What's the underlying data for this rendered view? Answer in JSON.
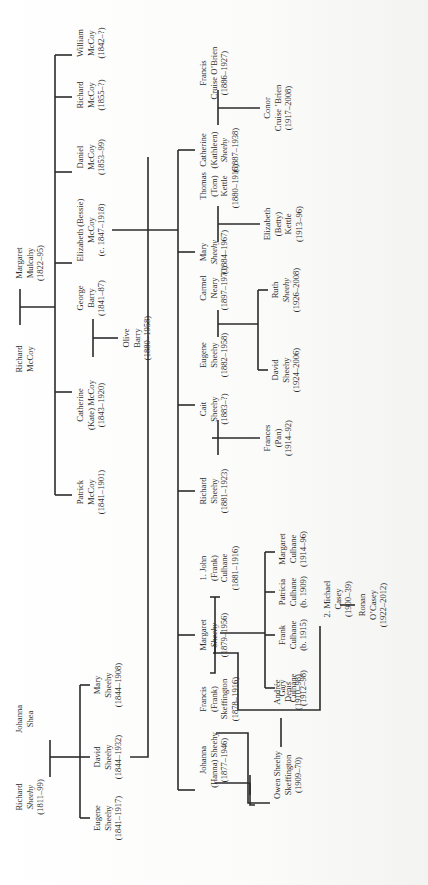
{
  "diagram": {
    "type": "family-tree",
    "orientation": "rotated-90-ccw",
    "line_color": "#2b2b2b",
    "background": "#fbfbfa"
  },
  "people": {
    "richard_sheehy_sr": {
      "lines": [
        "Richard",
        "Sheehy",
        "(1811–99)"
      ]
    },
    "johanna_shea": {
      "lines": [
        "Johanna",
        "Shea"
      ]
    },
    "eugene_sheehy_sr": {
      "lines": [
        "Eugene",
        "Sheehy",
        "(1841–1917)"
      ]
    },
    "david_sheehy": {
      "lines": [
        "David",
        "Sheehy",
        "(1844–1932)"
      ]
    },
    "mary_sheehy_sr": {
      "lines": [
        "Mary",
        "Sheehy",
        "(1844–1908)"
      ]
    },
    "richard_mccoy": {
      "lines": [
        "Richard",
        "McCoy"
      ]
    },
    "margaret_mulcahy": {
      "lines": [
        "Margaret",
        "Mulcahy",
        "(1822–95)"
      ]
    },
    "patrick_mccoy": {
      "lines": [
        "Patrick",
        "McCoy",
        "(1841–1901)"
      ]
    },
    "catherine_mccoy": {
      "lines": [
        "Catherine",
        "(Kate) McCoy",
        "(1843–1920)"
      ]
    },
    "george_barry": {
      "lines": [
        "George",
        "Barry",
        "(1841–87)"
      ]
    },
    "olive_barry": {
      "lines": [
        "Olive",
        "Barry",
        "(1880–1958)"
      ]
    },
    "elizabeth_mccoy": {
      "lines": [
        "Elizabeth (Bessie)",
        "McCoy",
        "(c. 1847–1918)"
      ]
    },
    "daniel_mccoy": {
      "lines": [
        "Daniel",
        "McCoy",
        "(1853–99)"
      ]
    },
    "richard_mccoy_jr": {
      "lines": [
        "Richard",
        "McCoy",
        "(1855–?)"
      ]
    },
    "william_mccoy": {
      "lines": [
        "William",
        "McCoy",
        "(1842–?)"
      ]
    },
    "johanna_hanna_sheehy": {
      "lines": [
        "Johanna",
        "(Hanna) Sheehy",
        "(1877–1946)"
      ]
    },
    "francis_skeffington": {
      "lines": [
        "Francis",
        "(Frank)",
        "Skeffington",
        "(1878–1916)"
      ]
    },
    "owen_sheehy_skeffington": {
      "lines": [
        "Owen Sheehy",
        "Skeffington",
        "(1909–70)"
      ]
    },
    "andree_denis": {
      "lines": [
        "Andrée",
        "Denis",
        "(1910–98)"
      ]
    },
    "margaret_sheehy": {
      "lines": [
        "Margaret",
        "Sheehy",
        "(1879–1956)"
      ]
    },
    "john_culhane": {
      "lines": [
        "1. John",
        "(Frank)",
        "Culhane",
        "(1881–1916)"
      ]
    },
    "michael_casey": {
      "lines": [
        "2. Michael",
        "Casey",
        "(1900–39)"
      ]
    },
    "ronan_ocasey": {
      "lines": [
        "Ronan",
        "O’Casey",
        "(1922–2012)"
      ]
    },
    "gary_culhane": {
      "lines": [
        "Gary",
        "Culhane",
        "(1912–98)"
      ]
    },
    "frank_culhane": {
      "lines": [
        "Frank",
        "Culhane",
        "(b. 1915)"
      ]
    },
    "patricia_culhane": {
      "lines": [
        "Patricia",
        "Culhane",
        "(b. 1909)"
      ]
    },
    "margaret_culhane": {
      "lines": [
        "Margaret",
        "Culhane",
        "(1914–96)"
      ]
    },
    "richard_sheehy": {
      "lines": [
        "Richard",
        "Sheehy",
        "(1881–1923)"
      ]
    },
    "cait_sheehy": {
      "lines": [
        "Cait",
        "Sheehy",
        "(1883–?)"
      ]
    },
    "frances_sheehy": {
      "lines": [
        "Frances",
        "(Pan)",
        "(1914–92)"
      ]
    },
    "eugene_sheehy": {
      "lines": [
        "Eugene",
        "Sheehy",
        "(1882–1958)"
      ]
    },
    "carmel_neary": {
      "lines": [
        "Carmel",
        "Neary",
        "(1897–1970)"
      ]
    },
    "david_sheehy_jr": {
      "lines": [
        "David",
        "Sheehy",
        "(1924–2006)"
      ]
    },
    "ruth_sheehy": {
      "lines": [
        "Ruth",
        "Sheehy",
        "(1926–2008)"
      ]
    },
    "mary_sheehy": {
      "lines": [
        "Mary",
        "Sheehy",
        "(1884–1967)"
      ]
    },
    "thomas_kettle": {
      "lines": [
        "Thomas",
        "(Tom)",
        "Kettle",
        "(1880–1916)"
      ]
    },
    "elizabeth_kettle": {
      "lines": [
        "Elizabeth",
        "(Betty)",
        "Kettle",
        "(1913–96)"
      ]
    },
    "catherine_sheehy": {
      "lines": [
        "Catherine",
        "(Kathleen)",
        "Sheehy",
        "(1887–1938)"
      ]
    },
    "francis_cruise_obrien": {
      "lines": [
        "Francis",
        "Cruise O’Brien",
        "(1886–1927)"
      ]
    },
    "conor_cruise_obrien": {
      "lines": [
        "Conor",
        "Cruise ’Brien",
        "(1917–2008)"
      ]
    }
  }
}
